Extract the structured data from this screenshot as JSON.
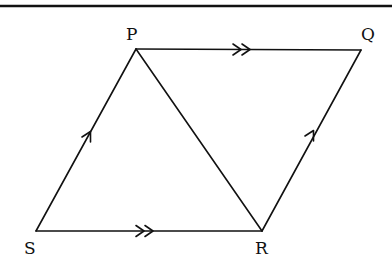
{
  "diagram": {
    "type": "parallelogram with diagonal",
    "vertices": [
      {
        "id": "P",
        "label": "P",
        "x": 136,
        "y": 49
      },
      {
        "id": "Q",
        "label": "Q",
        "x": 361,
        "y": 50
      },
      {
        "id": "R",
        "label": "R",
        "x": 262,
        "y": 231
      },
      {
        "id": "S",
        "label": "S",
        "x": 36,
        "y": 231
      }
    ],
    "edges": [
      {
        "from": "P",
        "to": "Q",
        "marker": "double-arrow"
      },
      {
        "from": "S",
        "to": "R",
        "marker": "double-arrow"
      },
      {
        "from": "S",
        "to": "P",
        "marker": "single-arrow"
      },
      {
        "from": "R",
        "to": "Q",
        "marker": "single-arrow"
      },
      {
        "from": "P",
        "to": "R",
        "marker": "none"
      }
    ],
    "labels": {
      "P": "P",
      "Q": "Q",
      "R": "R",
      "S": "S"
    },
    "top_rule": true,
    "stroke_color": "#111111",
    "background": "#ffffff"
  }
}
